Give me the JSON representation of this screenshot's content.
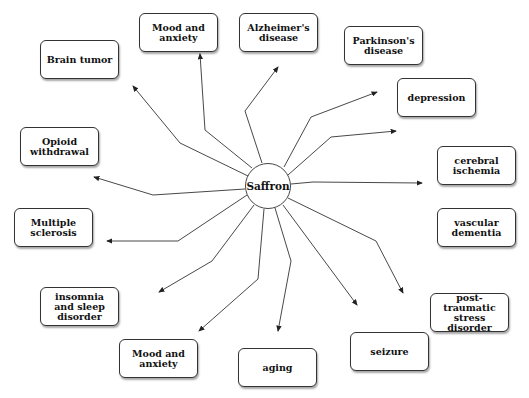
{
  "diagram": {
    "type": "radial concept map",
    "center": {
      "label": "Saffron"
    },
    "nodes": [
      {
        "id": "brain-tumor",
        "label": "Brain tumor"
      },
      {
        "id": "mood-anxiety-top",
        "label": "Mood and anxiety"
      },
      {
        "id": "alzheimers",
        "label": "Alzheimer's disease"
      },
      {
        "id": "parkinsons",
        "label": "Parkinson's disease"
      },
      {
        "id": "depression",
        "label": "depression"
      },
      {
        "id": "cerebral-ischemia",
        "label": "cerebral ischemia"
      },
      {
        "id": "vascular-dementia",
        "label": "vascular dementia"
      },
      {
        "id": "ptsd",
        "label": "post-traumatic stress disorder"
      },
      {
        "id": "seizure",
        "label": "seizure"
      },
      {
        "id": "aging",
        "label": "aging"
      },
      {
        "id": "mood-anxiety-bottom",
        "label": "Mood and anxiety"
      },
      {
        "id": "insomnia",
        "label": "insomnia and sleep disorder"
      },
      {
        "id": "multiple-sclerosis",
        "label": "Multiple sclerosis"
      },
      {
        "id": "opioid-withdrawal",
        "label": "Opioid withdrawal"
      }
    ],
    "edges_from_center": 14,
    "colors": {
      "line": "#333333",
      "box_border": "#333333",
      "background": "#ffffff"
    }
  }
}
